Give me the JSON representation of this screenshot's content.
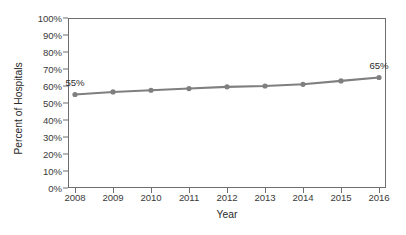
{
  "chart_data": {
    "type": "line",
    "title": "",
    "xlabel": "Year",
    "ylabel": "Percent of Hospitals",
    "categories": [
      "2008",
      "2009",
      "2010",
      "2011",
      "2012",
      "2013",
      "2014",
      "2015",
      "2016"
    ],
    "x": [
      2008,
      2009,
      2010,
      2011,
      2012,
      2013,
      2014,
      2015,
      2016
    ],
    "values": [
      55,
      56.5,
      57.5,
      58.5,
      59.5,
      60,
      61,
      63,
      65
    ],
    "series": [
      {
        "name": "Percent of Hospitals",
        "values": [
          55,
          56.5,
          57.5,
          58.5,
          59.5,
          60,
          61,
          63,
          65
        ]
      }
    ],
    "ylim": [
      0,
      100
    ],
    "ytick_labels": [
      "0%",
      "10%",
      "20%",
      "30%",
      "40%",
      "50%",
      "60%",
      "70%",
      "80%",
      "90%",
      "100%"
    ],
    "yticks": [
      0,
      10,
      20,
      30,
      40,
      50,
      60,
      70,
      80,
      90,
      100
    ],
    "grid": false,
    "legend": "none",
    "line_color": "#7f7f7f",
    "marker": "circle",
    "marker_color": "#7f7f7f",
    "frame_color": "#6e6e6e",
    "annotations": [
      {
        "label": "55%",
        "x": 2008,
        "y": 55
      },
      {
        "label": "65%",
        "x": 2016,
        "y": 65
      }
    ]
  }
}
